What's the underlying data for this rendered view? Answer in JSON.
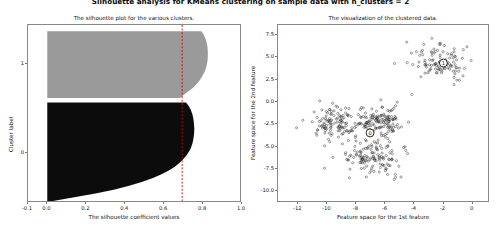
{
  "figure": {
    "suptitle": "Silhouette analysis for KMeans clustering on sample data with n_clusters = 2",
    "background": "#ffffff",
    "width": 501,
    "height": 236
  },
  "chart_data": [
    {
      "type": "area",
      "name": "silhouette-plot",
      "title": "The silhouette plot for the various clusters.",
      "xlabel": "The silhouette coefficient values",
      "ylabel": "Cluster label",
      "xlim": [
        -0.1,
        1.0
      ],
      "ylim": [
        0,
        520
      ],
      "grid": false,
      "xticks": [
        "-0.1",
        "0.0",
        "0.2",
        "0.4",
        "0.6",
        "0.8",
        "1.0"
      ],
      "xtick_values": [
        -0.1,
        0.0,
        0.2,
        0.4,
        0.6,
        0.8,
        1.0
      ],
      "yticks": [
        "0",
        "1"
      ],
      "ytick_positions": [
        0.72,
        0.22
      ],
      "average_silhouette_score": 0.7,
      "average_line_style": "dashed",
      "average_line_color": "#cc0000",
      "clusters": [
        {
          "label": "0",
          "color": "#0c0c0c",
          "size": 500,
          "y_start": 0.44,
          "y_end": 1.0,
          "silhouette_profile": [
            0.72,
            0.735,
            0.745,
            0.752,
            0.757,
            0.76,
            0.762,
            0.763,
            0.762,
            0.76,
            0.757,
            0.752,
            0.745,
            0.735,
            0.722,
            0.705,
            0.685,
            0.66,
            0.628,
            0.59,
            0.545,
            0.49,
            0.425,
            0.345,
            0.25,
            0.14,
            0.03
          ]
        },
        {
          "label": "1",
          "color": "#9a9a9a",
          "size": 250,
          "y_start": 0.035,
          "y_end": 0.415,
          "silhouette_profile": [
            0.8,
            0.812,
            0.82,
            0.826,
            0.83,
            0.832,
            0.833,
            0.833,
            0.832,
            0.83,
            0.826,
            0.82,
            0.812,
            0.802,
            0.79,
            0.775,
            0.758,
            0.735,
            0.71,
            0.69
          ]
        }
      ]
    },
    {
      "type": "scatter",
      "name": "cluster-visualization",
      "title": "The visualization of the clustered data.",
      "xlabel": "Feature space for the 1st feature",
      "ylabel": "Feature space for the 2nd feature",
      "xlim": [
        -13.4,
        1.2
      ],
      "ylim": [
        -11.3,
        8.6
      ],
      "grid": false,
      "xticks": [
        "-12",
        "-10",
        "-8",
        "-6",
        "-4",
        "-2",
        "0"
      ],
      "xtick_values": [
        -12,
        -10,
        -8,
        -6,
        -4,
        -2,
        0
      ],
      "yticks": [
        "7.5",
        "5.0",
        "2.5",
        "0.0",
        "-2.5",
        "-5.0",
        "-7.5",
        "-10.0"
      ],
      "ytick_values": [
        7.5,
        5.0,
        2.5,
        0.0,
        -2.5,
        -5.0,
        -7.5,
        -10.0
      ],
      "point_color": "#2a2a2a",
      "point_size": 1.1,
      "centroids": [
        {
          "label": "0",
          "x": -7.0,
          "y": -3.6
        },
        {
          "label": "1",
          "x": -1.9,
          "y": 4.3
        }
      ],
      "blobs": [
        {
          "cluster": "1",
          "cx": -2.0,
          "cy": 4.35,
          "sx": 0.95,
          "sy": 1.0,
          "n": 110
        },
        {
          "cluster": "0",
          "cx": -9.3,
          "cy": -2.6,
          "sx": 0.95,
          "sy": 0.95,
          "n": 130
        },
        {
          "cluster": "0",
          "cx": -6.1,
          "cy": -2.3,
          "sx": 0.85,
          "sy": 0.9,
          "n": 130
        },
        {
          "cluster": "0",
          "cx": -6.8,
          "cy": -6.4,
          "sx": 1.0,
          "sy": 0.95,
          "n": 130
        }
      ]
    }
  ]
}
